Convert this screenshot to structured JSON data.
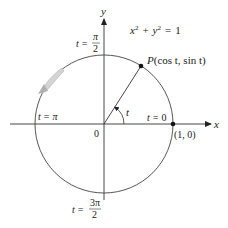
{
  "diagram": {
    "type": "unit-circle",
    "equation": {
      "x": "x",
      "x_exp": "2",
      "plus": "+",
      "y": "y",
      "y_exp": "2",
      "eq": "=",
      "rhs": "1"
    },
    "axes": {
      "x_label": "x",
      "y_label": "y",
      "origin_label": "0"
    },
    "point_P": {
      "label_P": "P",
      "label_coords": "(cos t, sin t)",
      "angle_deg": 57
    },
    "point_10": {
      "label": "(1, 0)"
    },
    "angle_label": "t",
    "t_labels": {
      "t0": {
        "lhs": "t",
        "eq": "=",
        "rhs": "0"
      },
      "tpi": {
        "lhs": "t",
        "eq": "=",
        "rhs": "π"
      },
      "tpi2": {
        "lhs": "t",
        "eq": "=",
        "num": "π",
        "den": "2"
      },
      "t3pi2": {
        "lhs": "t",
        "eq": "=",
        "num": "3π",
        "den": "2"
      }
    },
    "colors": {
      "line": "#333333",
      "arrow_fill": "#c8c8c8",
      "arrow_stroke": "#999999"
    }
  }
}
